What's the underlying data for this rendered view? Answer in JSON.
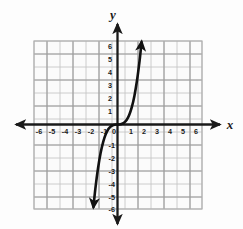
{
  "figure": {
    "background_color": "#fdfdfd",
    "grid_color": "#b9b9b9",
    "grid_major_color": "#8f8f8f",
    "axis_color": "#1a1a1a",
    "curve_color": "#111111",
    "width": 243,
    "height": 229
  },
  "axis_labels": {
    "x": "x",
    "y": "y"
  },
  "ticks": {
    "x_negative": [
      "-6",
      "-5",
      "-4",
      "-3",
      "-2",
      "-1"
    ],
    "x_positive": [
      "1",
      "2",
      "3",
      "4",
      "5",
      "6"
    ],
    "y_positive": [
      "6",
      "5",
      "4",
      "3",
      "2",
      "1"
    ],
    "y_negative": [
      "-1",
      "-2",
      "-3",
      "-4",
      "-5",
      "-6"
    ],
    "origin": "0"
  },
  "chart_data": {
    "type": "line",
    "title": "",
    "subtitle": "",
    "xlabel": "x",
    "ylabel": "y",
    "xlim": [
      -7,
      7
    ],
    "ylim": [
      -7,
      7
    ],
    "grid": true,
    "grid_step": 1,
    "legend": "none",
    "annotations": [
      "Arrowheads on both ends of the curve indicate the graph continues.",
      "Curve passes through the origin (0, 0)."
    ],
    "xticks": [
      -6,
      -5,
      -4,
      -3,
      -2,
      -1,
      0,
      1,
      2,
      3,
      4,
      5,
      6
    ],
    "yticks": [
      -6,
      -5,
      -4,
      -3,
      -2,
      -1,
      0,
      1,
      2,
      3,
      4,
      5,
      6
    ],
    "series": [
      {
        "name": "y = x^3",
        "function": "y = x^3",
        "color": "#111111",
        "x": [
          -1.85,
          -1.7,
          -1.5,
          -1.3,
          -1.1,
          -0.9,
          -0.7,
          -0.5,
          -0.3,
          -0.1,
          0,
          0.1,
          0.3,
          0.5,
          0.7,
          0.9,
          1.1,
          1.3,
          1.5,
          1.7,
          1.85
        ],
        "values": [
          -6.33,
          -4.91,
          -3.38,
          -2.2,
          -1.33,
          -0.73,
          -0.34,
          -0.13,
          -0.03,
          0,
          0,
          0,
          0.03,
          0.13,
          0.34,
          0.73,
          1.33,
          2.2,
          3.38,
          4.91,
          6.33
        ]
      }
    ]
  }
}
